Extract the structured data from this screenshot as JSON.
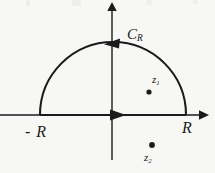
{
  "figure": {
    "background_color": "#f7f7f5",
    "ink_color": "#1b1b1b",
    "width": 215,
    "height": 173
  },
  "labels": {
    "contour": {
      "base": "C",
      "sub": "R"
    },
    "left_endpoint": "- R",
    "right_endpoint": "R",
    "pole_upper": {
      "base": "z",
      "sub": "1"
    },
    "pole_lower": {
      "base": "z",
      "sub": "2"
    }
  },
  "geometry": {
    "real_axis_y": 115,
    "imag_axis_x": 112,
    "real_axis_x_start": 0,
    "real_axis_x_end": 205,
    "imag_axis_y_top": 5,
    "imag_axis_y_bottom": 160,
    "arc_center_x": 113,
    "arc_center_y": 115,
    "arc_radius": 73,
    "arc_left_foot_x": 40,
    "arc_right_foot_x": 186,
    "arc_apex_y": 43,
    "pole_upper_dot": {
      "x": 149,
      "y": 92
    },
    "pole_lower_dot": {
      "x": 152,
      "y": 145
    },
    "dot_radius": 2.6,
    "arrow_on_arc_direction": "left",
    "arrow_on_real_axis_direction": "right"
  }
}
